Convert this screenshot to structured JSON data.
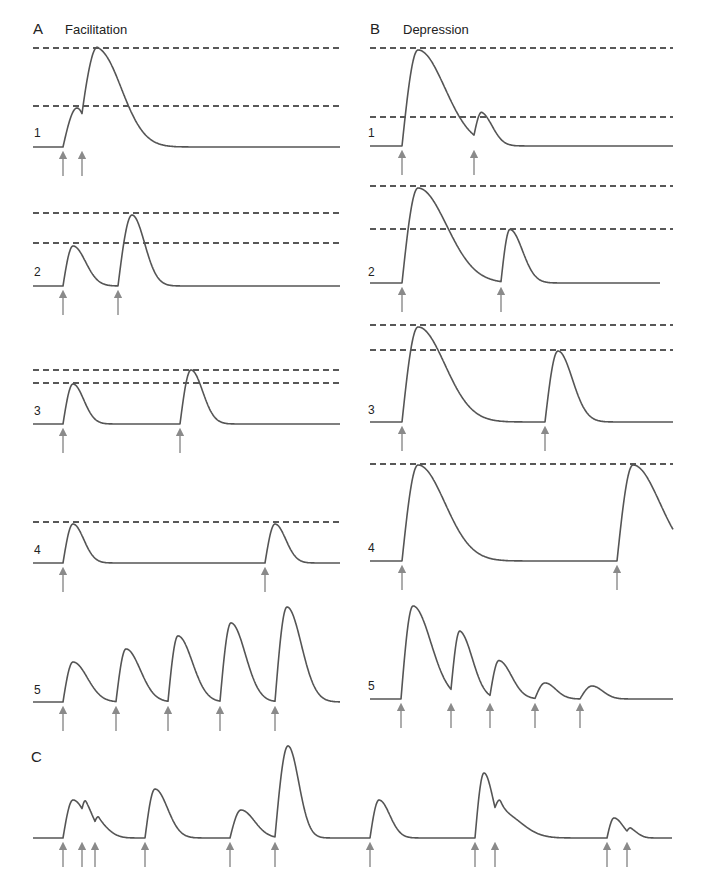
{
  "figure": {
    "panels": [
      {
        "id": "A",
        "letter": "A",
        "title": "Facilitation"
      },
      {
        "id": "B",
        "letter": "B",
        "title": "Depression"
      },
      {
        "id": "C",
        "letter": "C",
        "title": ""
      }
    ],
    "trace_numbers": [
      "1",
      "2",
      "3",
      "4",
      "5"
    ],
    "colors": {
      "trace": "#555555",
      "dashed_line": "#222222",
      "arrow": "#8a8a8a",
      "text": "#222222",
      "background": "#ffffff"
    }
  },
  "traces": {
    "A": [
      {
        "label": "1",
        "baseline_y": 147,
        "x_start": 33,
        "x_end": 340,
        "dashed": [
          48,
          106
        ],
        "events": [
          {
            "t": 63,
            "peak_y": 108,
            "w": 14,
            "tau": 10
          },
          {
            "t": 82,
            "peak_y": 50,
            "w": 16,
            "tau": 26
          }
        ],
        "arrows": [
          63,
          82
        ]
      },
      {
        "label": "2",
        "baseline_y": 286,
        "x_start": 33,
        "x_end": 340,
        "dashed": [
          213,
          243
        ],
        "events": [
          {
            "t": 63,
            "peak_y": 246,
            "w": 10,
            "tau": 14
          },
          {
            "t": 118,
            "peak_y": 215,
            "w": 14,
            "tau": 14
          }
        ],
        "arrows": [
          63,
          118
        ]
      },
      {
        "label": "3",
        "baseline_y": 424,
        "x_start": 33,
        "x_end": 340,
        "dashed": [
          370,
          383
        ],
        "events": [
          {
            "t": 63,
            "peak_y": 384,
            "w": 10,
            "tau": 12
          },
          {
            "t": 180,
            "peak_y": 370,
            "w": 11,
            "tau": 13
          }
        ],
        "arrows": [
          63,
          180
        ]
      },
      {
        "label": "4",
        "baseline_y": 563,
        "x_start": 33,
        "x_end": 340,
        "dashed": [
          522
        ],
        "events": [
          {
            "t": 63,
            "peak_y": 524,
            "w": 10,
            "tau": 12
          },
          {
            "t": 265,
            "peak_y": 524,
            "w": 10,
            "tau": 12
          }
        ],
        "arrows": [
          63,
          265
        ]
      },
      {
        "label": "5",
        "baseline_y": 702,
        "x_start": 33,
        "x_end": 340,
        "dashed": [],
        "events": [
          {
            "t": 63,
            "peak_y": 662,
            "w": 10,
            "tau": 16
          },
          {
            "t": 116,
            "peak_y": 649,
            "w": 10,
            "tau": 16
          },
          {
            "t": 168,
            "peak_y": 636,
            "w": 10,
            "tau": 16
          },
          {
            "t": 220,
            "peak_y": 623,
            "w": 11,
            "tau": 16
          },
          {
            "t": 275,
            "peak_y": 607,
            "w": 12,
            "tau": 16
          }
        ],
        "arrows": [
          63,
          116,
          168,
          220,
          275
        ]
      }
    ],
    "B": [
      {
        "label": "1",
        "baseline_y": 146,
        "x_start": 370,
        "x_end": 673,
        "dashed": [
          48,
          117
        ],
        "events": [
          {
            "t": 402,
            "peak_y": 50,
            "w": 16,
            "tau": 30
          },
          {
            "t": 474,
            "peak_y": 118,
            "w": 8,
            "tau": 12
          }
        ],
        "arrows": [
          402,
          474
        ]
      },
      {
        "label": "2",
        "baseline_y": 283,
        "x_start": 370,
        "x_end": 660,
        "dashed": [
          186,
          229
        ],
        "events": [
          {
            "t": 402,
            "peak_y": 188,
            "w": 16,
            "tau": 32
          },
          {
            "t": 501,
            "peak_y": 230,
            "w": 9,
            "tau": 14
          }
        ],
        "arrows": [
          402,
          501
        ]
      },
      {
        "label": "3",
        "baseline_y": 422,
        "x_start": 370,
        "x_end": 673,
        "dashed": [
          325,
          350
        ],
        "events": [
          {
            "t": 402,
            "peak_y": 327,
            "w": 16,
            "tau": 30
          },
          {
            "t": 545,
            "peak_y": 351,
            "w": 13,
            "tau": 16
          }
        ],
        "arrows": [
          402,
          545
        ]
      },
      {
        "label": "4",
        "baseline_y": 561,
        "x_start": 370,
        "x_end": 673,
        "dashed": [
          464
        ],
        "events": [
          {
            "t": 402,
            "peak_y": 465,
            "w": 16,
            "tau": 30
          },
          {
            "t": 617,
            "peak_y": 465,
            "w": 16,
            "tau": 30
          }
        ],
        "arrows": [
          402,
          617
        ]
      },
      {
        "label": "5",
        "baseline_y": 699,
        "x_start": 370,
        "x_end": 673,
        "dashed": [],
        "events": [
          {
            "t": 401,
            "peak_y": 606,
            "w": 12,
            "tau": 20
          },
          {
            "t": 451,
            "peak_y": 634,
            "w": 9,
            "tau": 14
          },
          {
            "t": 490,
            "peak_y": 661,
            "w": 9,
            "tau": 14
          },
          {
            "t": 535,
            "peak_y": 683,
            "w": 10,
            "tau": 12
          },
          {
            "t": 580,
            "peak_y": 686,
            "w": 12,
            "tau": 12
          }
        ],
        "arrows": [
          401,
          451,
          490,
          535,
          580
        ]
      }
    ],
    "C": [
      {
        "label": "",
        "baseline_y": 838,
        "x_start": 33,
        "x_end": 672,
        "dashed": [],
        "events": [
          {
            "t": 63,
            "peak_y": 800,
            "w": 10,
            "tau": 14
          },
          {
            "t": 82,
            "peak_y": 812,
            "w": 4,
            "tau": 10,
            "rel": true
          },
          {
            "t": 95,
            "peak_y": 818,
            "w": 4,
            "tau": 12,
            "rel": true
          },
          {
            "t": 145,
            "peak_y": 789,
            "w": 10,
            "tau": 14
          },
          {
            "t": 230,
            "peak_y": 810,
            "w": 11,
            "tau": 15
          },
          {
            "t": 275,
            "peak_y": 746,
            "w": 13,
            "tau": 12
          },
          {
            "t": 370,
            "peak_y": 800,
            "w": 9,
            "tau": 12
          },
          {
            "t": 475,
            "peak_y": 773,
            "w": 9,
            "tau": 10
          },
          {
            "t": 495,
            "peak_y": 792,
            "w": 6,
            "tau": 22,
            "rel": true
          },
          {
            "t": 607,
            "peak_y": 818,
            "w": 7,
            "tau": 10
          },
          {
            "t": 627,
            "peak_y": 826,
            "w": 4,
            "tau": 8,
            "rel": true
          }
        ],
        "arrows": [
          63,
          82,
          95,
          145,
          230,
          275,
          370,
          475,
          495,
          607,
          627
        ]
      }
    ]
  },
  "layout": {
    "letters": [
      {
        "text_path": "figure.panels.0.letter",
        "x": 33,
        "y": 19
      },
      {
        "text_path": "figure.panels.1.letter",
        "x": 370,
        "y": 19
      },
      {
        "text_path": "figure.panels.2.letter",
        "x": 33,
        "y": 746
      }
    ]
  }
}
